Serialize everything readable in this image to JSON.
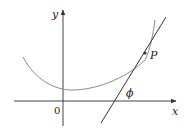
{
  "diagram": {
    "axes": {
      "x_label": "x",
      "y_label": "y",
      "origin_label": "0"
    },
    "labels": {
      "point": "P",
      "angle": "ϕ"
    },
    "elements": [
      {
        "type": "curve",
        "description": "concave-up curve with minimum near the y-axis"
      },
      {
        "type": "tangent-line",
        "description": "line tangent to curve at P, crossing x-axis at angle ϕ"
      },
      {
        "type": "point",
        "label": "P"
      }
    ],
    "colors": {
      "axes": "#333333",
      "curve": "#8a8a8a",
      "tangent": "#333333"
    }
  }
}
